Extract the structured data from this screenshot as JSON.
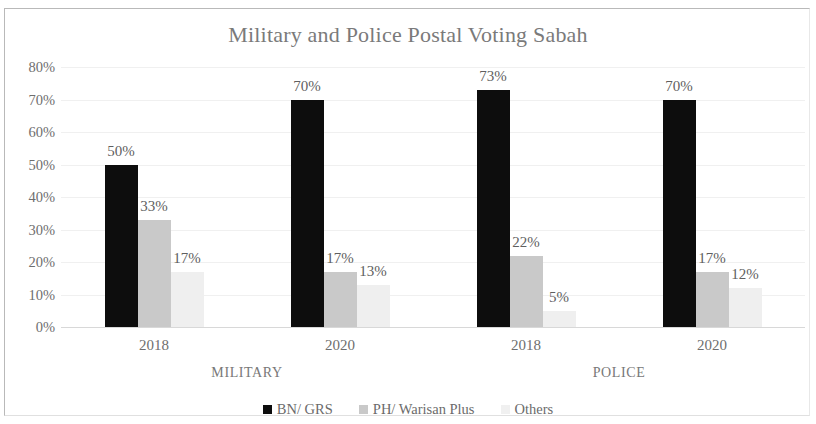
{
  "chart_data": {
    "type": "bar",
    "title": "Military and Police Postal Voting Sabah",
    "xlabel": "",
    "ylabel": "",
    "ylim": [
      0,
      80
    ],
    "ytick_labels": [
      "80%",
      "70%",
      "60%",
      "50%",
      "40%",
      "30%",
      "20%",
      "10%",
      "0%"
    ],
    "ytick_values": [
      80,
      70,
      60,
      50,
      40,
      30,
      20,
      10,
      0
    ],
    "grid": true,
    "legend_position": "bottom",
    "categories": [
      "2018",
      "2020",
      "2018",
      "2020"
    ],
    "category_groups": [
      {
        "label": "MILITARY",
        "categories": [
          "2018",
          "2020"
        ]
      },
      {
        "label": "POLICE",
        "categories": [
          "2018",
          "2020"
        ]
      }
    ],
    "series": [
      {
        "name": "BN/ GRS",
        "color": "#0d0d0d",
        "values": [
          50,
          70,
          73,
          70
        ],
        "value_labels": [
          "50%",
          "70%",
          "73%",
          "70%"
        ]
      },
      {
        "name": "PH/ Warisan Plus",
        "color": "#c9c9c9",
        "values": [
          33,
          17,
          22,
          17
        ],
        "value_labels": [
          "33%",
          "17%",
          "22%",
          "17%"
        ]
      },
      {
        "name": "Others",
        "color": "#efefef",
        "values": [
          17,
          13,
          5,
          12
        ],
        "value_labels": [
          "17%",
          "13%",
          "5%",
          "12%"
        ]
      }
    ]
  }
}
